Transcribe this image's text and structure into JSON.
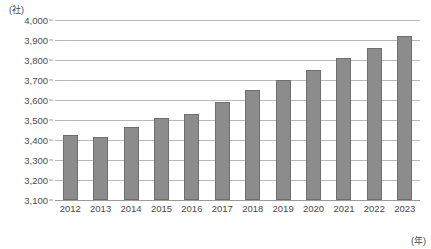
{
  "chart_data": {
    "type": "bar",
    "title": "",
    "xlabel": "(年)",
    "ylabel": "(社)",
    "categories": [
      "2012",
      "2013",
      "2014",
      "2015",
      "2016",
      "2017",
      "2018",
      "2019",
      "2020",
      "2021",
      "2022",
      "2023"
    ],
    "values": [
      3425,
      3415,
      3465,
      3510,
      3530,
      3590,
      3650,
      3700,
      3750,
      3810,
      3860,
      3920
    ],
    "ylim": [
      3100,
      4000
    ],
    "ytick_labels": [
      "4,000",
      "3,900",
      "3,800",
      "3,700",
      "3,600",
      "3,500",
      "3,400",
      "3,300",
      "3,200",
      "3,100"
    ],
    "ytick_values": [
      4000,
      3900,
      3800,
      3700,
      3600,
      3500,
      3400,
      3300,
      3200,
      3100
    ],
    "grid": true,
    "legend": "none",
    "bar_color": "#8c8c8c",
    "bar_border_color": "#6f6f6f",
    "grid_color": "#b9b9b9",
    "axis_color": "#9a9a9a",
    "text_color": "#4a4a4a"
  },
  "axes": {
    "y_unit_label": "(社)",
    "x_unit_label": "(年)"
  }
}
